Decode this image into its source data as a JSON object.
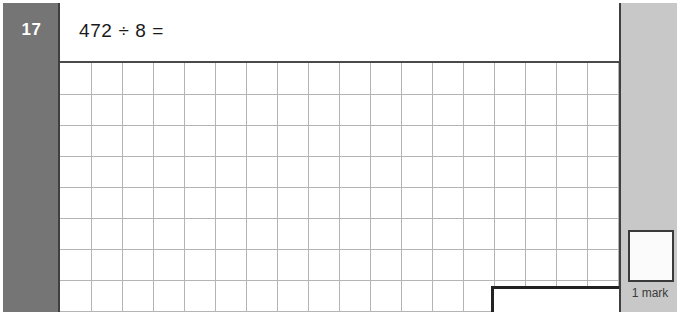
{
  "question": {
    "number": "17",
    "text": "472 ÷ 8 ="
  },
  "answer_box": {
    "value": ""
  },
  "marks": {
    "box_value": "",
    "label": "1 mark"
  },
  "work_grid": {
    "columns": 18,
    "rows": 8,
    "cell_size": 31
  },
  "colors": {
    "number_column_bg": "#757575",
    "marks_panel_bg": "#c8c8c8",
    "frame_border": "#4a4a4a",
    "grid_line": "#b4b4b4",
    "answer_box_border": "#222222",
    "page_bg": "#ffffff"
  }
}
